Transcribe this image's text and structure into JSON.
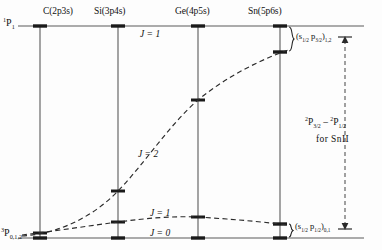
{
  "figure": {
    "type": "energy-level-correlation-diagram",
    "background_color": "#fdfdfd",
    "line_color": "#555555",
    "dash_color": "#333333",
    "text_color": "#111111"
  },
  "columns": [
    {
      "id": "C",
      "label": "C(2p3s)",
      "x": 40
    },
    {
      "id": "Si",
      "label": "Si(3p4s)",
      "x": 118
    },
    {
      "id": "Ge",
      "label": "Ge(4p5s)",
      "x": 198
    },
    {
      "id": "Sn",
      "label": "Sn(5p6s)",
      "x": 280
    }
  ],
  "terms": {
    "upper": {
      "multiplicity": "1",
      "letter": "P",
      "j": "1"
    },
    "lower": {
      "multiplicity": "3",
      "letter": "P",
      "j": "0,1,2"
    }
  },
  "curves": [
    {
      "name": "J=2",
      "label": "J = 2",
      "label_x": 138,
      "label_y": 150,
      "points": [
        [
          40,
          233
        ],
        [
          118,
          191
        ],
        [
          198,
          100
        ],
        [
          280,
          52
        ]
      ]
    },
    {
      "name": "J=1-lower",
      "label": "J = 1",
      "label_x": 150,
      "label_y": 212,
      "points": [
        [
          40,
          233
        ],
        [
          118,
          222
        ],
        [
          198,
          217
        ],
        [
          280,
          224
        ]
      ]
    }
  ],
  "axis_labels": {
    "j_upper": "J = 1",
    "j_upper_x": 140,
    "j_upper_y": 31,
    "j_zero": "J = 0",
    "j_zero_x": 150,
    "j_zero_y": 233
  },
  "annotations": {
    "upper_bracket_config": "(s1/2 p3/2)1,2",
    "lower_bracket_config": "(s1/2 p1/2)0,1",
    "splitting_expression": "2P3/2 - 2P1/2",
    "splitting_for": "for SnII"
  },
  "geometry": {
    "top_line_y": 26,
    "bottom_line_y": 238,
    "left_edge": 18,
    "right_edge": 364,
    "arrow_x": 345,
    "arrow_top_y": 38,
    "arrow_bottom_y": 228,
    "sn_upper_split_y": 52,
    "sn_lower_split_y": 224
  }
}
